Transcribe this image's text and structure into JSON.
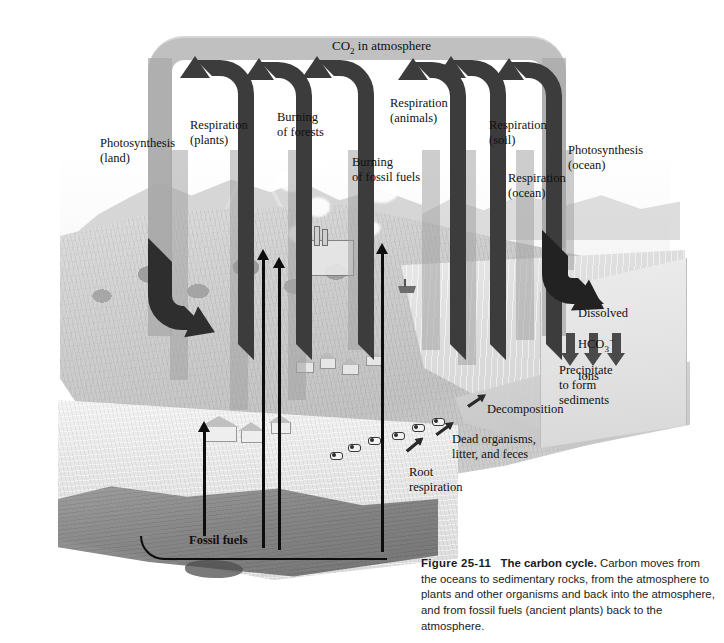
{
  "figure": {
    "top_label": "CO₂ in atmosphere",
    "top_label_plain": "CO2 in atmosphere"
  },
  "labels": [
    {
      "id": "photosynthesis-land",
      "text": "Photosynthesis\n(land)",
      "x": 100,
      "y": 136
    },
    {
      "id": "respiration-plants",
      "text": "Respiration\n(plants)",
      "x": 190,
      "y": 118
    },
    {
      "id": "burning-of-forests",
      "text": "Burning\nof forests",
      "x": 277,
      "y": 110
    },
    {
      "id": "respiration-animals",
      "text": "Respiration\n(animals)",
      "x": 390,
      "y": 96
    },
    {
      "id": "burning-fossil-fuels",
      "text": "Burning\nof fossil fuels",
      "x": 352,
      "y": 155
    },
    {
      "id": "respiration-soil",
      "text": "Respiration\n(soil)",
      "x": 489,
      "y": 118
    },
    {
      "id": "respiration-ocean",
      "text": "Respiration\n(ocean)",
      "x": 508,
      "y": 171
    },
    {
      "id": "photosynthesis-ocean",
      "text": "Photosynthesis\n(ocean)",
      "x": 568,
      "y": 143
    },
    {
      "id": "decomposition",
      "text": "Decomposition",
      "x": 487,
      "y": 402
    },
    {
      "id": "dead-organisms",
      "text": "Dead organisms,\nlitter, and feces",
      "x": 452,
      "y": 432
    },
    {
      "id": "root-respiration",
      "text": "Root\nrespiration",
      "x": 409,
      "y": 465
    },
    {
      "id": "fossil-fuels",
      "text": "Fossil fuels",
      "x": 189,
      "y": 533
    },
    {
      "id": "precipitate",
      "text": "Precipitate\nto form\nsediments",
      "x": 559,
      "y": 363
    }
  ],
  "dissolved_label": {
    "id": "dissolved-hco3-ions",
    "line1": "Dissolved",
    "line2_prefix": "HCO",
    "line2_sub": "3",
    "line2_sup": "−",
    "line3": "ions",
    "x": 578,
    "y": 291
  },
  "caption": {
    "figure_number": "Figure 25-11",
    "title": "The carbon cycle.",
    "body": " Carbon moves from the oceans to sedimentary rocks, from the atmosphere to plants and other organisms and back into the atmosphere, and from fossil fuels (ancient plants) back to the atmosphere."
  },
  "colors": {
    "band_gray": "#a8a8a8",
    "arrow_dark": "#3c3c3c",
    "text": "#111111",
    "caption_text": "#1b1b1b",
    "page_background": "#ffffff"
  },
  "arrows": {
    "up_arrows": [
      {
        "name": "respiration-plants-arrow",
        "x": 196,
        "y": 60,
        "w": 56,
        "h": 300
      },
      {
        "name": "burning-of-forests-arrow",
        "x": 258,
        "y": 62,
        "w": 50,
        "h": 300
      },
      {
        "name": "burning-fossil-fuels-arrow",
        "x": 314,
        "y": 60,
        "w": 54,
        "h": 300
      },
      {
        "name": "respiration-animals-arrow",
        "x": 412,
        "y": 62,
        "w": 52,
        "h": 300
      },
      {
        "name": "respiration-soil-arrow",
        "x": 448,
        "y": 60,
        "w": 54,
        "h": 300
      },
      {
        "name": "respiration-ocean-arrow",
        "x": 506,
        "y": 62,
        "w": 52,
        "h": 300
      }
    ],
    "down_arrows": [
      {
        "name": "photosynthesis-land-arrow",
        "x": 148,
        "y": 240
      },
      {
        "name": "photosynthesis-ocean-arrow",
        "x": 556,
        "y": 236
      }
    ],
    "fossil_fuel_arrows": [
      {
        "name": "fossil-fuel-arrow-1",
        "x": 203,
        "y": 430,
        "h": 105
      },
      {
        "name": "fossil-fuel-arrow-2",
        "x": 262,
        "y": 258,
        "h": 290
      },
      {
        "name": "fossil-fuel-arrow-3",
        "x": 278,
        "y": 268,
        "h": 285
      },
      {
        "name": "fossil-fuel-arrow-4",
        "x": 380,
        "y": 250,
        "h": 300
      }
    ],
    "precipitate_arrows": [
      {
        "name": "precipitate-arrow-1",
        "x": 566,
        "y": 333
      },
      {
        "name": "precipitate-arrow-2",
        "x": 589,
        "y": 333
      },
      {
        "name": "precipitate-arrow-3",
        "x": 612,
        "y": 333
      }
    ]
  }
}
